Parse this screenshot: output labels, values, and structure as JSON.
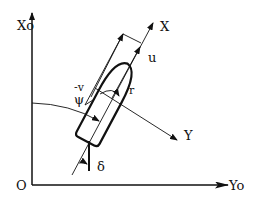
{
  "diagram": {
    "type": "ship-coordinate-system",
    "colors": {
      "stroke": "#111111",
      "background": "#ffffff"
    },
    "labels": {
      "earth_x_axis": "Xo",
      "earth_y_axis": "Yo",
      "origin": "O",
      "ship_x_axis": "X",
      "ship_y_axis": "Y",
      "surge_velocity": "u",
      "sway_velocity": "-v",
      "yaw_rate": "r",
      "heading_angle": "ψ",
      "rudder_angle": "δ"
    }
  }
}
